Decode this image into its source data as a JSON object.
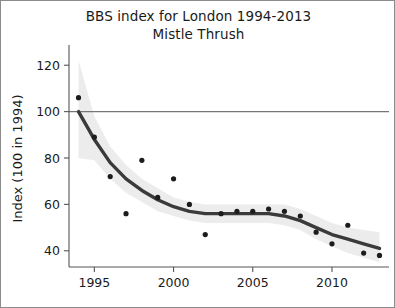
{
  "chart_data": {
    "type": "scatter",
    "title": "BBS index for London 1994-2013",
    "subtitle": "Mistle Thrush",
    "xlabel": "",
    "ylabel": "Index (100 in 1994)",
    "xlim": [
      1993.4,
      2013.6
    ],
    "ylim": [
      33,
      127
    ],
    "grid": false,
    "legend": "none",
    "x": [
      1994,
      1995,
      1996,
      1997,
      1998,
      1999,
      2000,
      2001,
      2002,
      2003,
      2004,
      2005,
      2006,
      2007,
      2008,
      2009,
      2010,
      2011,
      2012,
      2013
    ],
    "values": [
      106,
      89,
      72,
      56,
      79,
      63,
      71,
      60,
      47,
      56,
      57,
      57,
      58,
      57,
      55,
      48,
      43,
      51,
      39,
      38
    ],
    "xticks": [
      1995,
      2000,
      2005,
      2010
    ],
    "xtick_labels": [
      "1995",
      "2000",
      "2005",
      "2010"
    ],
    "yticks": [
      40,
      60,
      80,
      100,
      120
    ],
    "ytick_labels": [
      "40",
      "60",
      "80",
      "100",
      "120"
    ],
    "series": [
      {
        "name": "annual index points",
        "type": "scatter",
        "values": [
          106,
          89,
          72,
          56,
          79,
          63,
          71,
          60,
          47,
          56,
          57,
          57,
          58,
          57,
          55,
          48,
          43,
          51,
          39,
          38
        ]
      },
      {
        "name": "smoothed trend",
        "type": "line",
        "x": [
          1994,
          1995,
          1996,
          1997,
          1998,
          1999,
          2000,
          2001,
          2002,
          2003,
          2004,
          2005,
          2006,
          2007,
          2008,
          2009,
          2010,
          2011,
          2012,
          2013
        ],
        "values": [
          100,
          88,
          78,
          71,
          66,
          62,
          59,
          57,
          56,
          56,
          56,
          56,
          56,
          55,
          53,
          50,
          47,
          45,
          43,
          41
        ]
      },
      {
        "name": "confidence band upper",
        "type": "area",
        "values": [
          122,
          98,
          85,
          77,
          71,
          67,
          63,
          61,
          60,
          60,
          60,
          60,
          60,
          60,
          58,
          55,
          52,
          50,
          49,
          48
        ]
      },
      {
        "name": "confidence band lower",
        "type": "area",
        "values": [
          80,
          79,
          71,
          65,
          61,
          57,
          55,
          53,
          52,
          52,
          52,
          52,
          52,
          51,
          49,
          45,
          42,
          39,
          37,
          35
        ]
      }
    ],
    "annotations": [
      {
        "name": "reference-line",
        "type": "hline",
        "y": 100,
        "label": "baseline 100 (1994)"
      }
    ]
  }
}
